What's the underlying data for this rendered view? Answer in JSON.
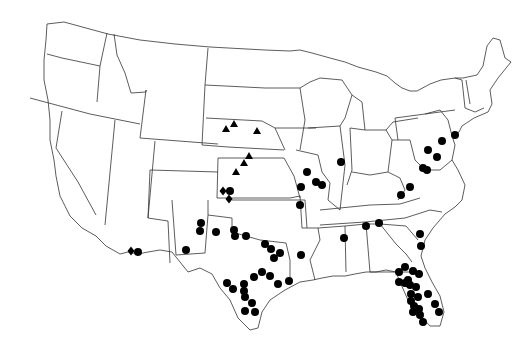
{
  "map": {
    "title": "",
    "region": "Contiguous United States",
    "background": "#ffffff",
    "stroke_color": "#333333",
    "marker_color": "#000000",
    "legend": [],
    "marker_types": [
      "circle",
      "triangle",
      "diamond"
    ]
  },
  "markers": {
    "triangles": [
      {
        "x": 226,
        "y": 129
      },
      {
        "x": 234,
        "y": 124
      },
      {
        "x": 257,
        "y": 131
      },
      {
        "x": 249,
        "y": 156
      },
      {
        "x": 244,
        "y": 163
      },
      {
        "x": 236,
        "y": 172
      }
    ],
    "diamonds": [
      {
        "x": 223,
        "y": 191
      },
      {
        "x": 229,
        "y": 199
      },
      {
        "x": 131,
        "y": 251
      }
    ],
    "circles": [
      {
        "x": 230,
        "y": 191
      },
      {
        "x": 201,
        "y": 223
      },
      {
        "x": 200,
        "y": 231
      },
      {
        "x": 216,
        "y": 232
      },
      {
        "x": 234,
        "y": 230
      },
      {
        "x": 235,
        "y": 236
      },
      {
        "x": 246,
        "y": 236
      },
      {
        "x": 186,
        "y": 250
      },
      {
        "x": 138,
        "y": 252
      },
      {
        "x": 265,
        "y": 244
      },
      {
        "x": 271,
        "y": 249
      },
      {
        "x": 280,
        "y": 253
      },
      {
        "x": 274,
        "y": 258
      },
      {
        "x": 262,
        "y": 272
      },
      {
        "x": 254,
        "y": 277
      },
      {
        "x": 270,
        "y": 276
      },
      {
        "x": 227,
        "y": 283
      },
      {
        "x": 233,
        "y": 289
      },
      {
        "x": 244,
        "y": 284
      },
      {
        "x": 244,
        "y": 291
      },
      {
        "x": 245,
        "y": 297
      },
      {
        "x": 252,
        "y": 303
      },
      {
        "x": 245,
        "y": 311
      },
      {
        "x": 255,
        "y": 312
      },
      {
        "x": 278,
        "y": 284
      },
      {
        "x": 289,
        "y": 281
      },
      {
        "x": 307,
        "y": 172
      },
      {
        "x": 301,
        "y": 187
      },
      {
        "x": 316,
        "y": 182
      },
      {
        "x": 322,
        "y": 185
      },
      {
        "x": 300,
        "y": 205
      },
      {
        "x": 341,
        "y": 162
      },
      {
        "x": 344,
        "y": 238
      },
      {
        "x": 379,
        "y": 223
      },
      {
        "x": 301,
        "y": 255
      },
      {
        "x": 442,
        "y": 141
      },
      {
        "x": 455,
        "y": 135
      },
      {
        "x": 428,
        "y": 150
      },
      {
        "x": 437,
        "y": 157
      },
      {
        "x": 423,
        "y": 168
      },
      {
        "x": 427,
        "y": 170
      },
      {
        "x": 410,
        "y": 187
      },
      {
        "x": 401,
        "y": 195
      },
      {
        "x": 420,
        "y": 234
      },
      {
        "x": 421,
        "y": 246
      },
      {
        "x": 366,
        "y": 226
      },
      {
        "x": 399,
        "y": 272
      },
      {
        "x": 405,
        "y": 267
      },
      {
        "x": 413,
        "y": 271
      },
      {
        "x": 408,
        "y": 280
      },
      {
        "x": 405,
        "y": 283
      },
      {
        "x": 399,
        "y": 282
      },
      {
        "x": 410,
        "y": 285
      },
      {
        "x": 419,
        "y": 274
      },
      {
        "x": 416,
        "y": 287
      },
      {
        "x": 411,
        "y": 294
      },
      {
        "x": 418,
        "y": 297
      },
      {
        "x": 411,
        "y": 301
      },
      {
        "x": 414,
        "y": 306
      },
      {
        "x": 419,
        "y": 309
      },
      {
        "x": 428,
        "y": 294
      },
      {
        "x": 435,
        "y": 304
      },
      {
        "x": 439,
        "y": 312
      },
      {
        "x": 423,
        "y": 322
      },
      {
        "x": 413,
        "y": 312
      },
      {
        "x": 420,
        "y": 315
      }
    ]
  }
}
